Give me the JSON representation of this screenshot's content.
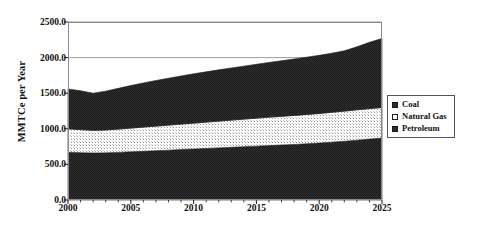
{
  "chart_data": {
    "type": "area",
    "stacked": true,
    "title": "",
    "xlabel": "",
    "ylabel": "MMTCe per Year",
    "xlim": [
      2000,
      2025
    ],
    "ylim": [
      0,
      2500
    ],
    "grid": true,
    "legend_position": "right-outside",
    "x": [
      2000,
      2001,
      2002,
      2003,
      2004,
      2005,
      2006,
      2007,
      2008,
      2009,
      2010,
      2011,
      2012,
      2013,
      2014,
      2015,
      2016,
      2017,
      2018,
      2019,
      2020,
      2021,
      2022,
      2023,
      2024,
      2025
    ],
    "x_ticks": [
      2000,
      2005,
      2010,
      2015,
      2020,
      2025
    ],
    "x_tick_labels": [
      "2000",
      "2005",
      "2010",
      "2015",
      "2020",
      "2025"
    ],
    "y_ticks": [
      0,
      500,
      1000,
      1500,
      2000,
      2500
    ],
    "y_tick_labels": [
      "0.0",
      "500.0",
      "1000.0",
      "1500.0",
      "2000.0",
      "2500.0"
    ],
    "series": [
      {
        "name": "Petroleum",
        "fill": "#2b2b2b",
        "stack_order": 1,
        "values": [
          670,
          665,
          660,
          662,
          668,
          676,
          684,
          692,
          700,
          708,
          716,
          724,
          732,
          740,
          748,
          756,
          764,
          772,
          780,
          790,
          800,
          812,
          825,
          840,
          855,
          870
        ]
      },
      {
        "name": "Natural Gas",
        "fill": "#f2f2f2",
        "stack_order": 2,
        "values": [
          330,
          324,
          318,
          322,
          328,
          334,
          340,
          346,
          352,
          358,
          364,
          370,
          376,
          382,
          388,
          394,
          400,
          404,
          408,
          412,
          416,
          420,
          424,
          427,
          429,
          430
        ]
      },
      {
        "name": "Coal",
        "fill": "#2b2b2b",
        "stack_order": 3,
        "values": [
          560,
          545,
          522,
          545,
          572,
          598,
          620,
          640,
          658,
          676,
          692,
          706,
          720,
          732,
          744,
          756,
          768,
          780,
          792,
          804,
          816,
          830,
          846,
          884,
          930,
          970
        ]
      }
    ],
    "cumulative_totals": [
      1560,
      1534,
      1500,
      1529,
      1568,
      1608,
      1644,
      1678,
      1710,
      1742,
      1772,
      1800,
      1828,
      1854,
      1880,
      1906,
      1932,
      1956,
      1980,
      2006,
      2032,
      2062,
      2095,
      2151,
      2214,
      2270
    ]
  },
  "legend": {
    "items": [
      {
        "label": "Coal",
        "swatch": "dark"
      },
      {
        "label": "Natural Gas",
        "swatch": "light"
      },
      {
        "label": "Petroleum",
        "swatch": "dark"
      }
    ]
  }
}
